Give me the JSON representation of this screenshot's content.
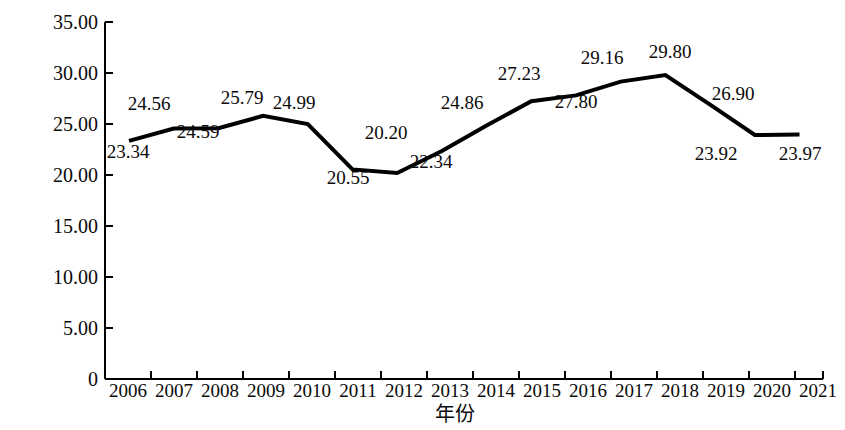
{
  "chart_data": {
    "type": "line",
    "title": "",
    "subtitle": "",
    "xlabel": "年份",
    "ylabel": "海洋生产总值占地区GDP比重/%",
    "categories": [
      "2006",
      "2007",
      "2008",
      "2009",
      "2010",
      "2011",
      "2012",
      "2013",
      "2014",
      "2015",
      "2016",
      "2017",
      "2018",
      "2019",
      "2020",
      "2021"
    ],
    "values": [
      23.34,
      24.56,
      24.59,
      25.79,
      24.99,
      20.55,
      20.2,
      22.34,
      24.86,
      27.23,
      27.8,
      29.16,
      29.8,
      26.9,
      23.92,
      23.97
    ],
    "series": [
      {
        "name": "海洋生产总值占地区GDP比重",
        "values": [
          23.34,
          24.56,
          24.59,
          25.79,
          24.99,
          20.55,
          20.2,
          22.34,
          24.86,
          27.23,
          27.8,
          29.16,
          29.8,
          26.9,
          23.92,
          23.97
        ]
      }
    ],
    "ylim": [
      0,
      35
    ],
    "xlim": [
      "2006",
      "2021"
    ],
    "ytick_labels": [
      "0",
      "5.00",
      "10.00",
      "15.00",
      "20.00",
      "25.00",
      "30.00",
      "35.00"
    ],
    "ytick_values": [
      0,
      5,
      10,
      15,
      20,
      25,
      30,
      35
    ],
    "data_label_format": "0.00",
    "data_label_positions": [
      "below",
      "above",
      "below",
      "above",
      "above",
      "below",
      "above",
      "below",
      "above",
      "above",
      "below",
      "above",
      "above",
      "above",
      "below",
      "below"
    ],
    "grid": false,
    "legend": false,
    "legend_position": "none",
    "line_color": "#000000",
    "line_width": 4,
    "markers": false,
    "background_color": "#ffffff",
    "axis_color": "#000000"
  },
  "axis": {
    "y_title": "海洋生产总值占地区GDP比重/%",
    "x_title": "年份"
  },
  "ytick_labels": [
    "35.00",
    "30.00",
    "25.00",
    "20.00",
    "15.00",
    "10.00",
    "5.00",
    "0"
  ],
  "xtick_labels": [
    "2006",
    "2007",
    "2008",
    "2009",
    "2010",
    "2011",
    "2012",
    "2013",
    "2014",
    "2015",
    "2016",
    "2017",
    "2018",
    "2019",
    "2020",
    "2021"
  ],
  "point_labels": [
    "23.34",
    "24.56",
    "24.59",
    "25.79",
    "24.99",
    "20.55",
    "20.20",
    "22.34",
    "24.86",
    "27.23",
    "27.80",
    "29.16",
    "29.80",
    "26.90",
    "23.92",
    "23.97"
  ]
}
